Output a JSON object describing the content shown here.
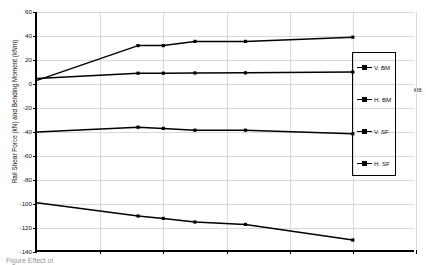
{
  "chart_data": {
    "type": "line",
    "title": "",
    "xlabel": "Curvature of Track (1/m)",
    "ylabel": "Rail Shear Force (kN) and Bending Moment (kNm)",
    "xlim": [
      0,
      0.006
    ],
    "ylim": [
      -140,
      60
    ],
    "xticks": [
      0.001,
      0.002,
      0.003,
      0.004,
      0.005,
      0.006
    ],
    "xtick_labels": [
      "0.001",
      "0.002",
      "0.003",
      "0.004",
      "0.005",
      "0.006"
    ],
    "yticks": [
      60,
      40,
      20,
      0,
      -20,
      -40,
      -60,
      -80,
      -100,
      -120,
      -140
    ],
    "ytick_labels": [
      "60",
      "40",
      "20",
      "0",
      "-20",
      "-40",
      "-60",
      "-80",
      "-100",
      "-120",
      "-140"
    ],
    "grid": true,
    "legend_position": "right",
    "marker": "square",
    "line_color": "#000000",
    "grid_color": "#d9d9d9",
    "x": [
      0.0,
      0.0016,
      0.002,
      0.0025,
      0.0033,
      0.005
    ],
    "series": [
      {
        "name": "V. BM",
        "values": [
          3.0,
          32.0,
          32.0,
          35.5,
          35.5,
          39.0
        ]
      },
      {
        "name": "H. BM",
        "values": [
          4.5,
          9.0,
          9.0,
          9.2,
          9.3,
          10.0
        ]
      },
      {
        "name": "V. SF",
        "values": [
          -40.0,
          -36.0,
          -37.0,
          -38.5,
          -38.5,
          -41.5
        ]
      },
      {
        "name": "H. SF",
        "values": [
          -99.0,
          -110.0,
          -112.0,
          -115.0,
          -117.0,
          -130.0
        ]
      }
    ]
  },
  "legend": {
    "items": [
      {
        "label": "V. BM"
      },
      {
        "label": "H. BM"
      },
      {
        "label": "V. SF"
      },
      {
        "label": "H. SF"
      }
    ]
  },
  "caption": {
    "text": "Figure   Effect of"
  }
}
